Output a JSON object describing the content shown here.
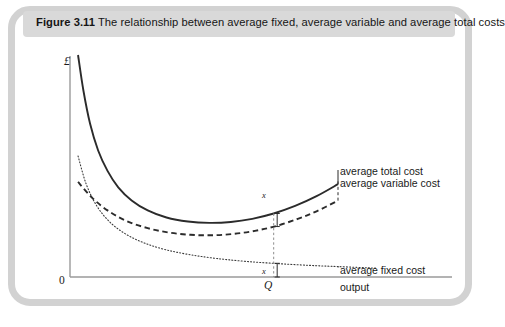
{
  "figure": {
    "number": "Figure 3.11",
    "caption": "The relationship between average fixed, average variable and average total costs",
    "frame_color": "#d2d2d2",
    "title_band_color": "#d9d9d9"
  },
  "chart_data": {
    "type": "line",
    "title": "The relationship between average fixed, average variable and average total costs",
    "xlabel": "output",
    "ylabel": "£",
    "grid": false,
    "legend_position": "right-inline",
    "axis": {
      "origin_label": "0",
      "x_tick_labels": [
        "Q"
      ],
      "y_tick_labels": [],
      "x_range_note": "no numeric scale",
      "y_range_note": "no numeric scale"
    },
    "annotations": [
      {
        "label": "x",
        "note": "gap between average total cost and average variable cost at output Q"
      },
      {
        "label": "x",
        "note": "average fixed cost at output Q, equal to the gap above"
      },
      {
        "label": "Q",
        "note": "chosen level of output marked on horizontal axis"
      }
    ],
    "series": [
      {
        "name": "average total cost",
        "style": "solid",
        "color": "#2b2b2b",
        "label": "average total cost",
        "x": [
          0.03,
          0.05,
          0.075,
          0.105,
          0.14,
          0.18,
          0.23,
          0.29,
          0.36,
          0.44,
          0.52,
          0.6,
          0.68,
          0.76,
          0.84,
          0.92,
          1.0
        ],
        "y": [
          1.0,
          0.84,
          0.69,
          0.57,
          0.478,
          0.404,
          0.345,
          0.3,
          0.268,
          0.25,
          0.244,
          0.248,
          0.262,
          0.286,
          0.32,
          0.364,
          0.418
        ]
      },
      {
        "name": "average variable cost",
        "style": "dashed",
        "color": "#2b2b2b",
        "label": "average variable cost",
        "x": [
          0.03,
          0.08,
          0.14,
          0.21,
          0.29,
          0.37,
          0.45,
          0.53,
          0.61,
          0.69,
          0.77,
          0.85,
          0.92,
          1.0
        ],
        "y": [
          0.428,
          0.36,
          0.3,
          0.253,
          0.22,
          0.2,
          0.19,
          0.188,
          0.194,
          0.208,
          0.23,
          0.262,
          0.296,
          0.344
        ]
      },
      {
        "name": "average fixed cost",
        "style": "dotted",
        "color": "#3a3a3a",
        "label": "average fixed cost",
        "x": [
          0.03,
          0.06,
          0.1,
          0.15,
          0.21,
          0.28,
          0.36,
          0.45,
          0.55,
          0.66,
          0.78,
          0.9,
          1.0,
          1.14
        ],
        "y": [
          0.545,
          0.42,
          0.32,
          0.246,
          0.192,
          0.152,
          0.122,
          0.1,
          0.083,
          0.07,
          0.06,
          0.052,
          0.047,
          0.04
        ]
      }
    ],
    "marker_output": {
      "label": "Q",
      "x": 0.76
    }
  },
  "labels": {
    "average_total_cost": "average total cost",
    "average_variable_cost": "average variable cost",
    "average_fixed_cost": "average fixed cost",
    "output_axis": "output",
    "currency_axis": "£",
    "origin": "0",
    "q_marker": "Q",
    "gap_upper": "x",
    "gap_lower": "x"
  }
}
